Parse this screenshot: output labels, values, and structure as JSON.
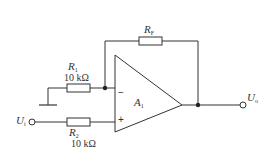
{
  "diagram": {
    "type": "op-amp circuit",
    "colors": {
      "wire": "#333333",
      "background": "#ffffff"
    },
    "opamp": {
      "name": "A",
      "subscript": "1",
      "inverting_label": "−",
      "noninverting_label": "+"
    },
    "resistors": [
      {
        "id": "R1",
        "name": "R",
        "subscript": "1",
        "value": "10 kΩ"
      },
      {
        "id": "R2",
        "name": "R",
        "subscript": "2",
        "value": "10 kΩ"
      },
      {
        "id": "RF",
        "name": "R",
        "subscript": "F",
        "value": ""
      }
    ],
    "terminals": {
      "input": {
        "name": "U",
        "subscript": "i"
      },
      "output": {
        "name": "U",
        "subscript": "o"
      }
    },
    "ground": "ground-symbol"
  }
}
